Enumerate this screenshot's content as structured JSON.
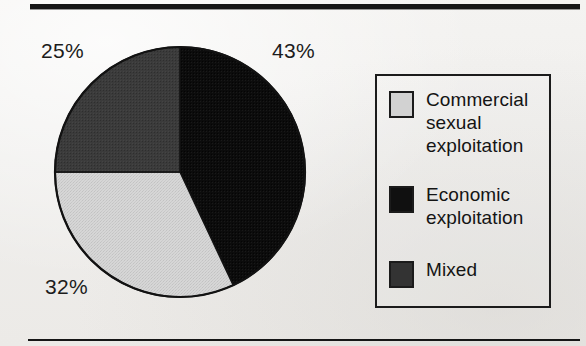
{
  "figure": {
    "background_color": "#f2f1ef",
    "top_rule_color": "#161616",
    "bottom_rule_color": "#161616"
  },
  "chart_data": {
    "type": "pie",
    "title": "",
    "subtitle": "",
    "xlabel": "",
    "ylabel": "",
    "grid": false,
    "legend_position": "right",
    "start_angle_deg": 0,
    "direction": "clockwise",
    "categories": [
      "Economic exploitation",
      "Commercial sexual exploitation",
      "Mixed"
    ],
    "values": [
      43,
      32,
      25
    ],
    "units": "percent",
    "slices": [
      {
        "label": "Economic exploitation",
        "value": 43,
        "value_text": "43%",
        "color": "#0d0d0d",
        "fill_style": "solid-black",
        "start_deg": 0,
        "end_deg": 154.8
      },
      {
        "label": "Commercial sexual exploitation",
        "value": 32,
        "value_text": "32%",
        "color": "#d2d2d2",
        "fill_style": "light-gray-stipple",
        "start_deg": 154.8,
        "end_deg": 270.0
      },
      {
        "label": "Mixed",
        "value": 25,
        "value_text": "25%",
        "color": "#3a3a3a",
        "fill_style": "dark-gray",
        "start_deg": 270.0,
        "end_deg": 360.0
      }
    ],
    "annotations": [
      {
        "text": "43%",
        "slice": "Economic exploitation"
      },
      {
        "text": "25%",
        "slice": "Mixed"
      },
      {
        "text": "32%",
        "slice": "Commercial sexual exploitation"
      }
    ],
    "outline_color": "#141414"
  },
  "legend": {
    "border_color": "#1b1b1b",
    "items": [
      {
        "label": "Commercial\nsexual\nexploitation",
        "swatch_color": "#d2d2d2",
        "swatch_border": "#1b1b1b"
      },
      {
        "label": "Economic\nexploitation",
        "swatch_color": "#101010",
        "swatch_border": "#1b1b1b"
      },
      {
        "label": "Mixed",
        "swatch_color": "#333333",
        "swatch_border": "#1b1b1b"
      }
    ]
  }
}
